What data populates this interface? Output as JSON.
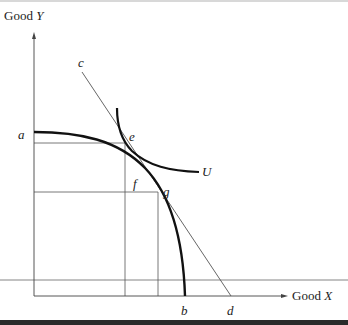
{
  "diagram": {
    "axes": {
      "y_label_prefix": "Good ",
      "y_label_var": "Y",
      "x_label_prefix": "Good ",
      "x_label_var": "X"
    },
    "points": {
      "a": "a",
      "b": "b",
      "c": "c",
      "d": "d",
      "e": "e",
      "f": "f",
      "g": "g",
      "U": "U"
    },
    "curves": [
      {
        "name": "production-possibility-frontier",
        "from": "a",
        "to": "b"
      },
      {
        "name": "price-line",
        "from": "c",
        "to": "d"
      },
      {
        "name": "indifference-curve",
        "label": "U"
      }
    ],
    "colors": {
      "thick_curve": "#111111",
      "thin_line": "#555555",
      "bottom_bar": "#2a2a2a"
    }
  }
}
